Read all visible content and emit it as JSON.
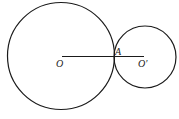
{
  "diagram": {
    "stroke_color": "#1a1a1a",
    "labels": {
      "center_large": "O",
      "tangent_point": "A",
      "center_small": "O′"
    },
    "shapes": [
      {
        "kind": "circle",
        "name": "large-circle",
        "center_label": "O"
      },
      {
        "kind": "circle",
        "name": "small-circle",
        "center_label": "O′"
      },
      {
        "kind": "segment",
        "name": "center-line",
        "from": "O",
        "to": "O′",
        "passes_through": "A"
      }
    ]
  }
}
